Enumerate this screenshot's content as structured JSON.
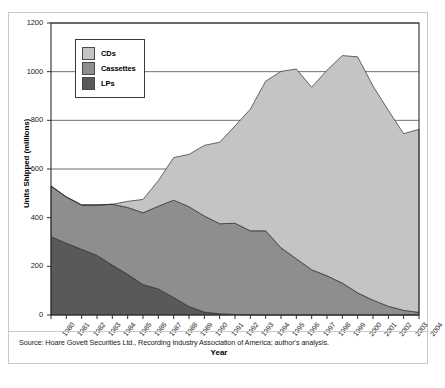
{
  "figure": {
    "source_note": "Source: Hoare Govett Securities Ltd., Recording Industry Association of America; author's analysis."
  },
  "legend": {
    "position": "inside-top-left",
    "items": [
      {
        "label": "CDs",
        "color": "#c4c4c4"
      },
      {
        "label": "Cassettes",
        "color": "#8e8e8e"
      },
      {
        "label": "LPs",
        "color": "#595959"
      }
    ]
  },
  "chart_data": {
    "type": "area",
    "stacked": true,
    "title": "",
    "xlabel": "Year",
    "ylabel": "Units Shipped (millions)",
    "xlim": [
      1980,
      2004
    ],
    "ylim": [
      0,
      1200
    ],
    "ytick_step": 200,
    "grid": true,
    "yticks": [
      0,
      200,
      400,
      600,
      800,
      1000,
      1200
    ],
    "categories": [
      "1980",
      "1981",
      "1982",
      "1983",
      "1984",
      "1985",
      "1986",
      "1987",
      "1988",
      "1989",
      "1990",
      "1991",
      "1992",
      "1993",
      "1994",
      "1995",
      "1996",
      "1997",
      "1998",
      "1999",
      "2000",
      "2001",
      "2002",
      "2003",
      "2004"
    ],
    "series": [
      {
        "name": "LPs",
        "color": "#595959",
        "values": [
          322,
          295,
          270,
          245,
          205,
          167,
          125,
          107,
          72,
          35,
          12,
          5,
          2,
          1,
          1,
          1,
          1,
          1,
          1,
          1,
          1,
          1,
          1,
          1,
          1
        ]
      },
      {
        "name": "Cassettes",
        "color": "#8e8e8e",
        "values": [
          208,
          190,
          182,
          207,
          250,
          275,
          295,
          340,
          400,
          410,
          395,
          370,
          375,
          345,
          345,
          275,
          230,
          185,
          160,
          130,
          90,
          60,
          35,
          18,
          10
        ]
      },
      {
        "name": "CDs",
        "color": "#c4c4c4",
        "values": [
          0,
          0,
          0,
          0,
          0,
          25,
          55,
          105,
          175,
          215,
          290,
          335,
          400,
          500,
          615,
          725,
          780,
          750,
          845,
          935,
          970,
          880,
          805,
          726,
          752
        ]
      }
    ],
    "totals": [
      530,
      485,
      452,
      452,
      455,
      467,
      475,
      552,
      647,
      660,
      697,
      710,
      777,
      846,
      961,
      1001,
      1011,
      936,
      1006,
      1066,
      1061,
      941,
      841,
      745,
      763
    ]
  }
}
